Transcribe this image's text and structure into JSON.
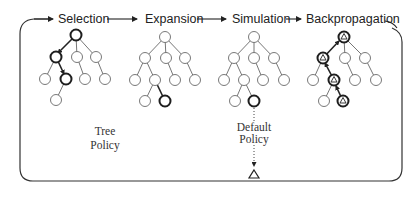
{
  "stages": [
    {
      "label": "Selection"
    },
    {
      "label": "Expansion"
    },
    {
      "label": "Simulation"
    },
    {
      "label": "Backpropagation"
    }
  ],
  "annotations": {
    "tree_policy": [
      "Tree",
      "Policy"
    ],
    "default_policy": [
      "Default",
      "Policy"
    ]
  },
  "colors": {
    "line": "#333333",
    "node_stroke": "#6a6a6a",
    "highlight_stroke": "#1e1e1e",
    "background": "#ffffff"
  }
}
